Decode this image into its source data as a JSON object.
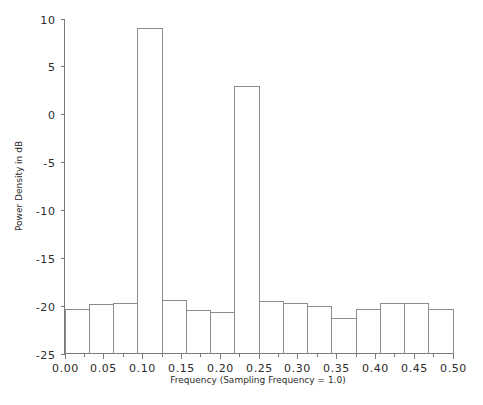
{
  "chart_data": {
    "type": "bar",
    "title": "",
    "subtitle": "",
    "xlabel": "Frequency (Sampling Frequency = 1.0)",
    "ylabel": "Power Density in dB",
    "xlim": [
      0.0,
      0.5
    ],
    "ylim": [
      -25,
      10
    ],
    "grid": false,
    "legend": null,
    "bar_style": "step-outline",
    "x_tick_labels": [
      "0.00",
      "0.05",
      "0.10",
      "0.15",
      "0.20",
      "0.25",
      "0.30",
      "0.35",
      "0.40",
      "0.45",
      "0.50"
    ],
    "x_tick_values": [
      0.0,
      0.05,
      0.1,
      0.15,
      0.2,
      0.25,
      0.3,
      0.35,
      0.4,
      0.45,
      0.5
    ],
    "x_minor_tick_values": [
      0.025,
      0.075,
      0.125,
      0.175,
      0.225,
      0.275,
      0.325,
      0.375,
      0.425,
      0.475
    ],
    "y_tick_labels": [
      "10",
      "5",
      "0",
      "-5",
      "-10",
      "-15",
      "-20",
      "-25"
    ],
    "y_tick_values": [
      10,
      5,
      0,
      -5,
      -10,
      -15,
      -20,
      -25
    ],
    "bin_edges": [
      0.0,
      0.03125,
      0.0625,
      0.09375,
      0.125,
      0.15625,
      0.1875,
      0.21875,
      0.25,
      0.28125,
      0.3125,
      0.34375,
      0.375,
      0.40625,
      0.4375,
      0.46875,
      0.5
    ],
    "categories": [
      "0.0156",
      "0.0469",
      "0.0781",
      "0.1094",
      "0.1406",
      "0.1719",
      "0.2031",
      "0.2344",
      "0.2656",
      "0.2969",
      "0.3281",
      "0.3594",
      "0.3906",
      "0.4219",
      "0.4531",
      "0.4844"
    ],
    "values": [
      -20.3,
      -19.8,
      -19.7,
      9.0,
      -19.4,
      -20.5,
      -20.7,
      3.0,
      -19.5,
      -19.7,
      -20.0,
      -21.3,
      -20.4,
      -19.7,
      -19.7,
      -20.3
    ],
    "colors": {
      "background": "#ffffff",
      "axis": "#7a7a7a",
      "bar_stroke": "#8c8c8c",
      "text": "#2b2b2b"
    }
  }
}
